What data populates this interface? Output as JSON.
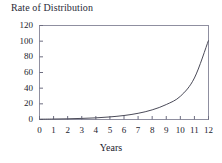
{
  "chart_data": {
    "type": "line",
    "title": "Rate of Distribution",
    "xlabel": "Years",
    "ylabel": "",
    "xlim": [
      0,
      12
    ],
    "ylim": [
      0,
      120
    ],
    "grid": false,
    "legend": null,
    "xticks": [
      "0",
      "1",
      "2",
      "3",
      "4",
      "5",
      "6",
      "7",
      "8",
      "9",
      "10",
      "11",
      "12"
    ],
    "yticks": [
      "0",
      "20",
      "40",
      "60",
      "80",
      "100",
      "120"
    ],
    "x": [
      0,
      1,
      2,
      3,
      4,
      5,
      6,
      7,
      8,
      9,
      10,
      11,
      12
    ],
    "values": [
      0.4,
      0.6,
      0.9,
      1.4,
      2.1,
      3.3,
      5.1,
      7.9,
      12.3,
      19.1,
      29.6,
      53.0,
      101.0
    ],
    "series": [
      {
        "name": "Rate of Distribution",
        "color": "#4a4a58",
        "values": [
          0.4,
          0.6,
          0.9,
          1.4,
          2.1,
          3.3,
          5.1,
          7.9,
          12.3,
          19.1,
          29.6,
          53.0,
          101.0
        ]
      }
    ],
    "annotations": []
  },
  "axes": {
    "frame_color": "#8f8fa0",
    "tick_color": "#6d6d80",
    "text_color": "#22222e"
  },
  "background": {
    "color": "#ffffff"
  }
}
